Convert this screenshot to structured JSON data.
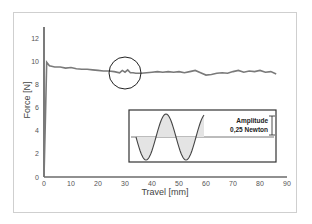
{
  "chart_data": {
    "type": "line",
    "title": "",
    "xlabel": "Travel [mm]",
    "ylabel": "Force [N]",
    "xlim": [
      0,
      90
    ],
    "ylim": [
      0,
      13
    ],
    "x_ticks": [
      0,
      10,
      20,
      30,
      40,
      50,
      60,
      70,
      80,
      90
    ],
    "y_ticks": [
      0,
      2,
      4,
      6,
      8,
      10,
      12
    ],
    "grid": false,
    "series": [
      {
        "name": "Force",
        "color": "#777777",
        "x": [
          0,
          0.5,
          1,
          2,
          4,
          6,
          8,
          10,
          12,
          14,
          16,
          18,
          20,
          22,
          24,
          26,
          28,
          29,
          30,
          31,
          32,
          33,
          34,
          36,
          38,
          40,
          42,
          44,
          46,
          48,
          50,
          52,
          54,
          56,
          58,
          60,
          62,
          64,
          66,
          68,
          70,
          72,
          74,
          76,
          78,
          80,
          82,
          84,
          86
        ],
        "y": [
          0,
          5,
          9.9,
          9.6,
          9.5,
          9.5,
          9.4,
          9.45,
          9.35,
          9.3,
          9.3,
          9.25,
          9.2,
          9.15,
          9.15,
          9.1,
          9.0,
          9.2,
          9.05,
          9.25,
          9.0,
          9.0,
          8.95,
          8.95,
          9.0,
          9.05,
          9.1,
          9.05,
          9.1,
          9.05,
          9.1,
          9.0,
          9.1,
          9.2,
          9.0,
          8.8,
          8.85,
          8.95,
          9.0,
          8.95,
          9.1,
          9.2,
          9.05,
          9.15,
          9.1,
          9.2,
          9.05,
          9.1,
          8.9
        ]
      }
    ],
    "annotations": [
      {
        "type": "circle",
        "x": 30,
        "y": 9.1,
        "note": "highlighted region"
      },
      {
        "type": "inset",
        "label_line1": "Amplitude",
        "label_line2": "0,25 Newton",
        "content": "sine wave illustrating oscillation amplitude"
      }
    ]
  },
  "inset": {
    "label_line1": "Amplitude",
    "label_line2": "0,25 Newton"
  },
  "axes": {
    "xlabel": "Travel [mm]",
    "ylabel": "Force [N]"
  }
}
